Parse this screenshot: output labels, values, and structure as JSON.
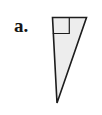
{
  "figure": {
    "label": "a.",
    "label_position": {
      "x": 14,
      "y": 16
    },
    "background_color": "#ffffff",
    "shape": {
      "name": "right-triangle",
      "kind": "triangle",
      "fill_color": "#ededed",
      "stroke_color": "#1d1d1d",
      "stroke_width": 1.6,
      "vertices": [
        {
          "name": "top-left",
          "x": 52.5,
          "y": 17.5
        },
        {
          "name": "top-right",
          "x": 86.5,
          "y": 17.5
        },
        {
          "name": "bottom",
          "x": 57.0,
          "y": 103.0
        }
      ],
      "points_attr": "52.5,17.5 86.5,17.5 57.0,103.0"
    },
    "right_angle_marker": {
      "name": "right-angle-square",
      "at_vertex": "top-left",
      "size": 16,
      "stroke_color": "#1d1d1d",
      "stroke_width": 1.2,
      "fill": "none",
      "points_attr": "52.8,33.5 69.3,33.5 69.3,17.9"
    }
  }
}
